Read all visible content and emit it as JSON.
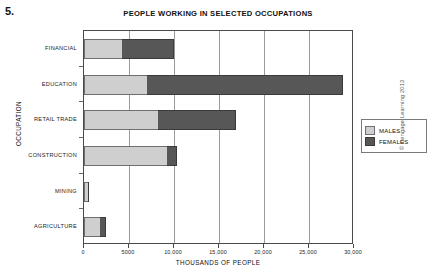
{
  "question_number": "5.",
  "credit": "© Cengage Learning 2013",
  "legend": {
    "position": "right",
    "entries": [
      {
        "label": "MALES",
        "color": "#cfcfcf"
      },
      {
        "label": "FEMALES",
        "color": "#575757"
      }
    ]
  },
  "chart_data": {
    "type": "bar",
    "orientation": "horizontal",
    "stacked": true,
    "title": "PEOPLE WORKING IN SELECTED OCCUPATIONS",
    "xlabel": "THOUSANDS OF PEOPLE",
    "ylabel": "OCCUPATION",
    "xlim": [
      0,
      30000
    ],
    "xticks": [
      0,
      5000,
      10000,
      15000,
      20000,
      25000,
      30000
    ],
    "xticklabels": [
      "0",
      "5000",
      "10,000",
      "15,000",
      "20,000",
      "25,000",
      "30,000"
    ],
    "grid": "vertical",
    "categories": [
      "FINANCIAL",
      "EDUCATION",
      "RETAIL TRADE",
      "CONSTRUCTION",
      "MINING",
      "AGRICULTURE"
    ],
    "series": [
      {
        "name": "MALES",
        "color": "#cfcfcf",
        "values": [
          4200,
          7000,
          8200,
          9200,
          400,
          1800
        ]
      },
      {
        "name": "FEMALES",
        "color": "#575757",
        "values": [
          5800,
          21800,
          8700,
          1100,
          200,
          600
        ]
      }
    ],
    "totals": [
      10000,
      28800,
      16900,
      10300,
      600,
      2400
    ]
  }
}
